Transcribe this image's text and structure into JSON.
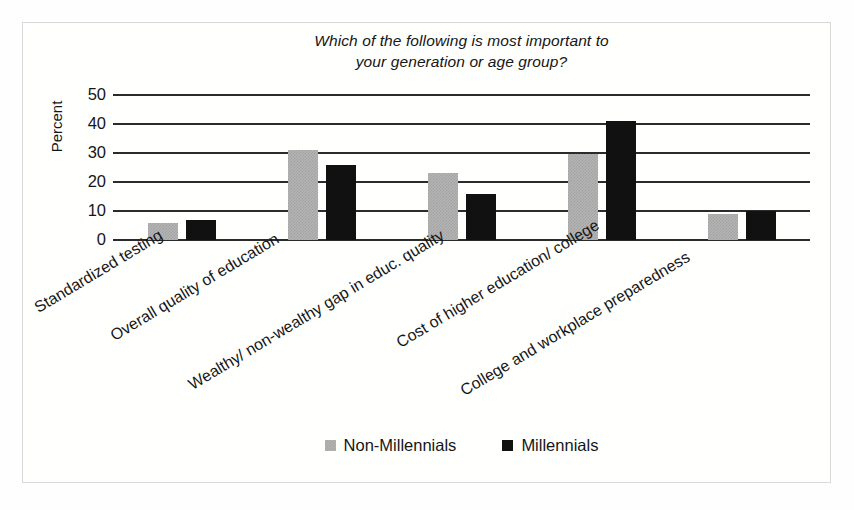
{
  "chart_data": {
    "type": "bar",
    "title": "Which of the following is most important to your generation or age group?",
    "title_lines": [
      "Which of the following is most important to",
      "your generation or age group?"
    ],
    "xlabel": "",
    "ylabel": "Percent",
    "ylim": [
      0,
      50
    ],
    "yticks": [
      0,
      10,
      20,
      30,
      40,
      50
    ],
    "ytick_labels": [
      "0",
      "10",
      "20",
      "30",
      "40",
      "50"
    ],
    "grid": true,
    "grid_axis": "y",
    "legend_position": "bottom-center",
    "categories": [
      "Standardized testing",
      "Overall quality of education",
      "Wealthy/ non-wealthy gap in educ. quality",
      "Cost of higher education/ college",
      "College and workplace preparedness"
    ],
    "series": [
      {
        "name": "Non-Millennials",
        "color": "#b4b4b4",
        "values": [
          6,
          31,
          23,
          29.5,
          9
        ]
      },
      {
        "name": "Millennials",
        "color": "#111111",
        "values": [
          7,
          26,
          16,
          41,
          10
        ]
      }
    ]
  },
  "legend": {
    "items": [
      {
        "label": "Non-Millennials",
        "swatch": "#b4b4b4"
      },
      {
        "label": "Millennials",
        "swatch": "#111111"
      }
    ]
  },
  "axis": {
    "y_title": "Percent"
  }
}
